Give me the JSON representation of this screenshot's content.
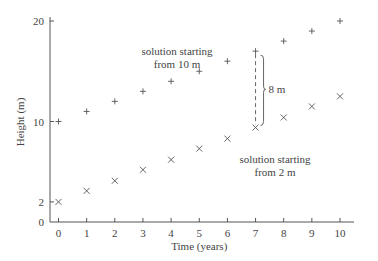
{
  "chart_data": {
    "type": "scatter",
    "title": "",
    "xlabel": "Time (years)",
    "ylabel": "Height (m)",
    "x": [
      0,
      1,
      2,
      3,
      4,
      5,
      6,
      7,
      8,
      9,
      10
    ],
    "xticks": [
      "0",
      "1",
      "2",
      "3",
      "4",
      "5",
      "6",
      "7",
      "8",
      "9",
      "10"
    ],
    "yticks": [
      "0",
      "2",
      "10",
      "20"
    ],
    "xlim": [
      0,
      10.5
    ],
    "ylim": [
      0,
      20.5
    ],
    "grid": false,
    "series": [
      {
        "name": "solution starting from 10 m",
        "marker": "+",
        "values": [
          10,
          11,
          12,
          13,
          14,
          15,
          16,
          17,
          18,
          19,
          20
        ]
      },
      {
        "name": "solution starting from 2 m",
        "marker": "x",
        "values": [
          2,
          3.1,
          4.1,
          5.2,
          6.2,
          7.3,
          8.3,
          9.4,
          10.4,
          11.5,
          12.5
        ]
      }
    ],
    "annotations": [
      {
        "text_line1": "solution starting",
        "text_line2": "from 10 m"
      },
      {
        "text_line1": "solution starting",
        "text_line2": "from 2 m"
      },
      {
        "text": "8 m",
        "at_x": 7
      }
    ]
  }
}
